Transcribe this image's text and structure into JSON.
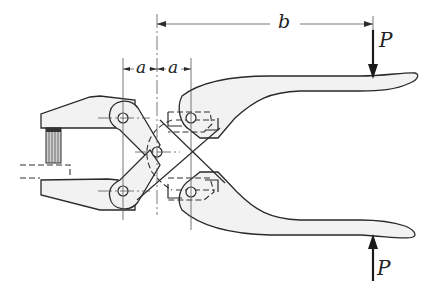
{
  "figure": {
    "labels": {
      "b": "b",
      "a_left": "a",
      "a_right": "a",
      "p_top": "P",
      "p_bottom": "P"
    },
    "dimensions": [
      {
        "name": "b",
        "description": "horizontal distance from center pivot to point of applied force P"
      },
      {
        "name": "a",
        "description": "horizontal spacing between left pin column and center pin"
      },
      {
        "name": "a",
        "description": "horizontal spacing between center pin and right pin column"
      }
    ],
    "forces": [
      {
        "name": "P",
        "direction": "down",
        "location": "upper handle tip"
      },
      {
        "name": "P",
        "direction": "up",
        "location": "lower handle tip"
      }
    ],
    "colors": {
      "line": "#2a2a2a",
      "fill": "#f2f2f2",
      "background": "#ffffff"
    }
  }
}
